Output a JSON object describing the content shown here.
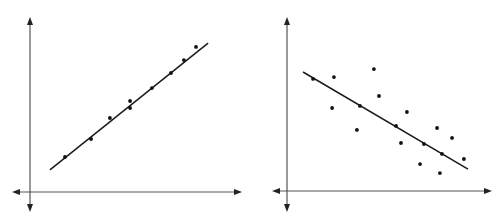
{
  "chart_data": [
    {
      "type": "scatter",
      "title": "",
      "xlabel": "",
      "ylabel": "",
      "grid": false,
      "legend": null,
      "xlim": [
        0,
        10
      ],
      "ylim": [
        0,
        10
      ],
      "description": "Strong positive linear correlation with fitted regression line",
      "points": [
        {
          "x": 1.65,
          "y": 2.0
        },
        {
          "x": 2.88,
          "y": 3.03
        },
        {
          "x": 3.77,
          "y": 4.23
        },
        {
          "x": 4.72,
          "y": 5.2
        },
        {
          "x": 4.72,
          "y": 4.8
        },
        {
          "x": 5.75,
          "y": 5.94
        },
        {
          "x": 6.65,
          "y": 6.8
        },
        {
          "x": 7.26,
          "y": 7.54
        },
        {
          "x": 7.83,
          "y": 8.29
        }
      ],
      "trendline": {
        "x1": 0.94,
        "y1": 1.26,
        "x2": 8.4,
        "y2": 8.51
      }
    },
    {
      "type": "scatter",
      "title": "",
      "xlabel": "",
      "ylabel": "",
      "grid": false,
      "legend": null,
      "xlim": [
        0,
        10
      ],
      "ylim": [
        0,
        10
      ],
      "description": "Moderate negative linear correlation with fitted regression line",
      "points": [
        {
          "x": 1.27,
          "y": 6.44
        },
        {
          "x": 2.29,
          "y": 6.55
        },
        {
          "x": 4.24,
          "y": 7.01
        },
        {
          "x": 4.49,
          "y": 5.46
        },
        {
          "x": 2.2,
          "y": 4.77
        },
        {
          "x": 3.56,
          "y": 4.89
        },
        {
          "x": 3.41,
          "y": 3.51
        },
        {
          "x": 5.85,
          "y": 4.54
        },
        {
          "x": 5.32,
          "y": 3.74
        },
        {
          "x": 7.32,
          "y": 3.62
        },
        {
          "x": 8.05,
          "y": 3.05
        },
        {
          "x": 5.56,
          "y": 2.76
        },
        {
          "x": 6.68,
          "y": 2.7
        },
        {
          "x": 7.56,
          "y": 2.13
        },
        {
          "x": 8.63,
          "y": 1.84
        },
        {
          "x": 6.49,
          "y": 1.55
        },
        {
          "x": 7.46,
          "y": 1.03
        }
      ],
      "trendline": {
        "x1": 0.78,
        "y1": 6.84,
        "x2": 8.83,
        "y2": 1.26
      }
    }
  ],
  "layout": [
    {
      "origin_px": [
        30,
        192
      ],
      "x_axis_px": [
        12,
        242
      ],
      "y_axis_px": [
        17,
        212
      ],
      "unit_px": [
        21.2,
        17.5
      ]
    },
    {
      "origin_px": [
        35,
        191
      ],
      "x_axis_px": [
        20,
        240
      ],
      "y_axis_px": [
        17,
        212
      ],
      "unit_px": [
        20.5,
        17.4
      ]
    }
  ],
  "colors": {
    "axis": "#555555",
    "arrow": "#222222",
    "trendline": "#1a1a1a",
    "point": "#111111",
    "background": "#ffffff"
  }
}
